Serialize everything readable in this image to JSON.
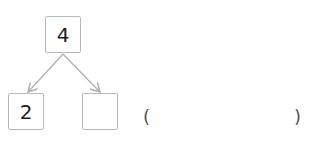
{
  "diagram": {
    "type": "number-bond",
    "top": {
      "value": "4"
    },
    "children": [
      {
        "value": "2"
      },
      {
        "value": ""
      }
    ],
    "answer": {
      "open_paren": "(",
      "close_paren": ")",
      "value": ""
    },
    "colors": {
      "box_border": "#b8b8b8",
      "arrow": "#b0b0b0",
      "text": "#222222"
    }
  }
}
